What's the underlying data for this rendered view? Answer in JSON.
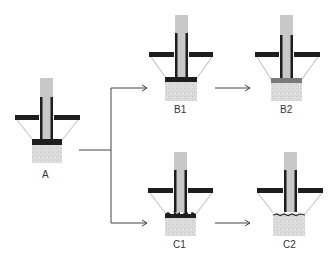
{
  "figure": {
    "labels": {
      "A": "A",
      "B1": "B1",
      "B2": "B2",
      "C1": "C1",
      "C2": "C2"
    },
    "colors": {
      "stem": "#c8c8c8",
      "dark": "#1e1e1e",
      "block": "#d8d8d8",
      "gray_cap": "#7a7a7a",
      "line": "#555555"
    }
  }
}
